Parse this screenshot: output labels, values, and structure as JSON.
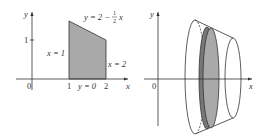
{
  "left_diagram": {
    "axes": {
      "x_label": "x",
      "y_label": "y",
      "origin_label": "0"
    },
    "ticks": {
      "x": [
        "1",
        "2"
      ],
      "y": [
        "1"
      ]
    },
    "curves": {
      "top": "y = 2 − ½x",
      "left": "x = 1",
      "right": "x = 2",
      "bottom": "y = 0"
    },
    "region": {
      "fill": "#a9a9a9",
      "vertices": [
        [
          1,
          0
        ],
        [
          1,
          1.5
        ],
        [
          2,
          1
        ],
        [
          2,
          0
        ]
      ]
    }
  },
  "right_diagram": {
    "axes": {
      "x_label": "x",
      "y_label": "y",
      "origin_label": "0"
    },
    "solid": "frustum of revolution about x-axis",
    "disk_fill": "#a9a9a9"
  },
  "labels": {
    "left_top_eq_prefix": "y = 2 − ",
    "left_top_eq_frac_num": "1",
    "left_top_eq_frac_den": "2",
    "left_top_eq_suffix": "x"
  }
}
